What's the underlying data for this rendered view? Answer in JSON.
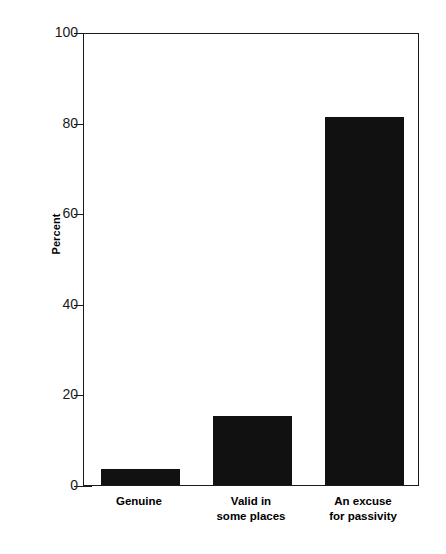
{
  "chart_data": {
    "type": "bar",
    "title": "",
    "subtitle": "",
    "xlabel": "",
    "ylabel": "Percent",
    "ylim": [
      0,
      100
    ],
    "yticks": [
      0,
      20,
      40,
      60,
      80,
      100
    ],
    "ytick_labels": [
      "0",
      "20",
      "40",
      "60",
      "80",
      "100"
    ],
    "grid": false,
    "legend": null,
    "categories": [
      "Genuine",
      "Valid in\nsome places",
      "An excuse\nfor passivity"
    ],
    "values": [
      3.5,
      15.3,
      81.2
    ],
    "bar_color": "#111111",
    "frame_color": "#1a1a1a",
    "background": "#ffffff"
  },
  "axis": {
    "y_title": "Percent",
    "ticks": [
      {
        "value": 100,
        "label": "100"
      },
      {
        "value": 80,
        "label": "80"
      },
      {
        "value": 60,
        "label": "60"
      },
      {
        "value": 40,
        "label": "40"
      },
      {
        "value": 20,
        "label": "20"
      },
      {
        "value": 0,
        "label": "0"
      }
    ]
  },
  "bars": [
    {
      "label": "Genuine",
      "value": 3.5
    },
    {
      "label": "Valid in\nsome places",
      "value": 15.3
    },
    {
      "label": "An excuse\nfor passivity",
      "value": 81.2
    }
  ]
}
